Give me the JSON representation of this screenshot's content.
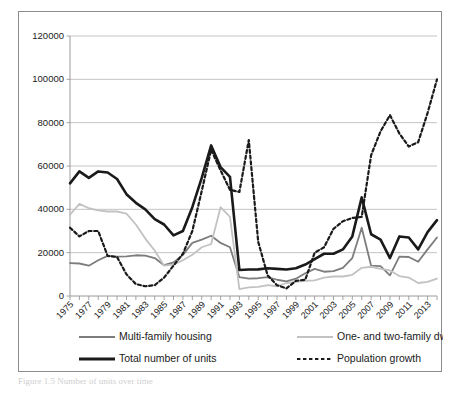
{
  "figure": {
    "caption": "Figure 1.5 Number of units over time",
    "background": "#ffffff",
    "frame_color": "#8c8c8c"
  },
  "chart_data": {
    "type": "line",
    "title": "",
    "xlabel": "",
    "ylabel": "",
    "ylim": [
      0,
      120000
    ],
    "ytick_values": [
      0,
      20000,
      40000,
      60000,
      80000,
      100000,
      120000
    ],
    "ytick_labels": [
      "0",
      "20000",
      "40000",
      "60000",
      "80000",
      "100000",
      "120000"
    ],
    "grid": true,
    "grid_axis": "y",
    "legend_position": "below-axes",
    "x": [
      1975,
      1976,
      1977,
      1978,
      1979,
      1980,
      1981,
      1982,
      1983,
      1984,
      1985,
      1986,
      1987,
      1988,
      1989,
      1990,
      1991,
      1992,
      1993,
      1994,
      1995,
      1996,
      1997,
      1998,
      1999,
      2000,
      2001,
      2002,
      2003,
      2004,
      2005,
      2006,
      2007,
      2008,
      2009,
      2010,
      2011,
      2012,
      2013,
      2014
    ],
    "xtick_labels": [
      "1975",
      "1977",
      "1979",
      "1981",
      "1983",
      "1985",
      "1987",
      "1989",
      "1991",
      "1993",
      "1995",
      "1997",
      "1999",
      "2001",
      "2003",
      "2005",
      "2007",
      "2009",
      "2011",
      "2013"
    ],
    "xtick_values": [
      1975,
      1977,
      1979,
      1981,
      1983,
      1985,
      1987,
      1989,
      1991,
      1993,
      1995,
      1997,
      1999,
      2001,
      2003,
      2005,
      2007,
      2009,
      2011,
      2013
    ],
    "series": [
      {
        "name": "Multi-family housing",
        "color": "#7d7d7d",
        "style": "solid",
        "width": 1.8,
        "values": [
          15200,
          15000,
          14000,
          16500,
          18500,
          18200,
          18300,
          18800,
          18600,
          17500,
          14200,
          15500,
          19000,
          24500,
          26000,
          27800,
          24500,
          22500,
          8700,
          8000,
          8200,
          8700,
          7500,
          6800,
          8000,
          10500,
          12500,
          11200,
          11500,
          13000,
          17500,
          31500,
          14000,
          13800,
          9500,
          18200,
          18000,
          15800,
          21500,
          27000
        ]
      },
      {
        "name": "One- and two-family dwellings",
        "color": "#c2c2c2",
        "style": "solid",
        "width": 1.8,
        "values": [
          37500,
          42500,
          40500,
          39500,
          39000,
          39000,
          38000,
          33000,
          26500,
          21000,
          14000,
          14500,
          16500,
          19000,
          22500,
          24000,
          41000,
          36500,
          3200,
          4000,
          4200,
          5000,
          4500,
          6000,
          6500,
          7000,
          7200,
          8500,
          9000,
          9000,
          9800,
          13000,
          13500,
          12500,
          11800,
          9200,
          8500,
          6000,
          6500,
          8000
        ]
      },
      {
        "name": "Total number of units",
        "color": "#1a1a1a",
        "style": "solid",
        "width": 2.6,
        "values": [
          52000,
          57500,
          54500,
          57500,
          57000,
          54000,
          47000,
          43000,
          40000,
          35500,
          33000,
          28000,
          30000,
          41000,
          54500,
          69500,
          59500,
          55000,
          12000,
          12200,
          12300,
          12800,
          12500,
          12200,
          12800,
          14500,
          17000,
          19500,
          19500,
          21500,
          27500,
          45500,
          28500,
          26000,
          17500,
          27500,
          27000,
          21500,
          29500,
          35000
        ]
      },
      {
        "name": "Population growth",
        "color": "#1a1a1a",
        "style": "dashed",
        "width": 2.2,
        "values": [
          31500,
          27500,
          30000,
          30000,
          18500,
          18000,
          10000,
          5500,
          4500,
          5000,
          8500,
          14000,
          19500,
          30000,
          48500,
          67500,
          58000,
          49000,
          48000,
          72000,
          25000,
          9500,
          5000,
          3500,
          7000,
          7500,
          20000,
          22500,
          31000,
          34500,
          36000,
          36500,
          65000,
          76000,
          83500,
          75000,
          69000,
          71000,
          84500,
          100000
        ]
      }
    ]
  },
  "legend": {
    "items": [
      {
        "label": "Multi-family housing",
        "color": "#7d7d7d",
        "style": "solid",
        "width": 1.8
      },
      {
        "label": "One- and two-family dwellings",
        "color": "#c2c2c2",
        "style": "solid",
        "width": 1.8
      },
      {
        "label": "Total number of units",
        "color": "#1a1a1a",
        "style": "solid",
        "width": 2.8
      },
      {
        "label": "Population growth",
        "color": "#1a1a1a",
        "style": "dashed",
        "width": 2.2
      }
    ]
  }
}
